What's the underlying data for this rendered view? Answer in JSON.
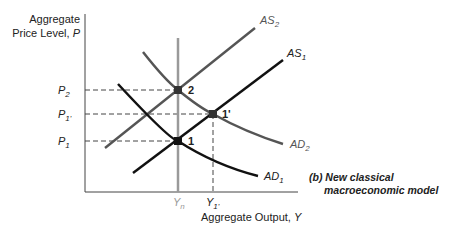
{
  "diagram": {
    "y_axis_label_line1": "Aggregate",
    "y_axis_label_line2": "Price Level, ",
    "y_axis_var": "P",
    "x_axis_label": "Aggregate Output, ",
    "x_axis_var": "Y",
    "caption_line1": "(b) New classical",
    "caption_line2": "macroeconomic model",
    "price_ticks": [
      {
        "base": "P",
        "sub": "2"
      },
      {
        "base": "P",
        "sub": "1'"
      },
      {
        "base": "P",
        "sub": "1"
      }
    ],
    "output_ticks": [
      {
        "base": "Y",
        "sub": "n"
      },
      {
        "base": "Y",
        "sub": "1'"
      }
    ],
    "curves": {
      "AS2": {
        "base": "AS",
        "sub": "2"
      },
      "AS1": {
        "base": "AS",
        "sub": "1"
      },
      "AD2": {
        "base": "AD",
        "sub": "2"
      },
      "AD1": {
        "base": "AD",
        "sub": "1"
      }
    },
    "points": {
      "p2": "2",
      "p1prime": "1'",
      "p1": "1"
    },
    "colors": {
      "as1": "#111111",
      "ad1": "#111111",
      "as2": "#555555",
      "ad2": "#555555",
      "lras": "#9a9a9a",
      "axis": "#444444"
    }
  }
}
